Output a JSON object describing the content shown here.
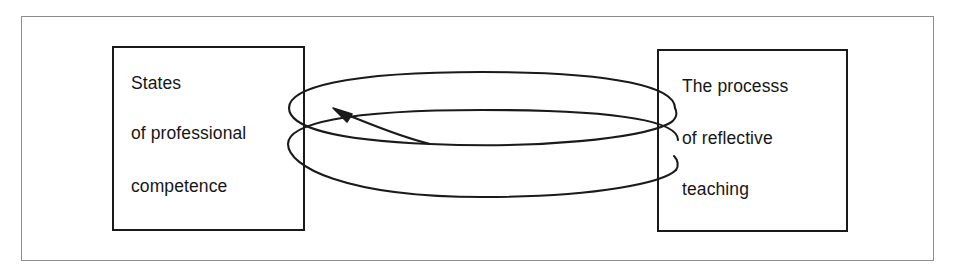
{
  "figure": {
    "kind": "cycle-diagram",
    "background_color": "#ffffff",
    "frame_color": "#8d8d8d",
    "box_border_color": "#1a1a1a",
    "text_color": "#161616",
    "coil_color": "#1a1a1a"
  },
  "left_box": {
    "name": "States of professional competence",
    "lines": [
      "States",
      "of professional",
      "competence"
    ]
  },
  "right_box": {
    "name": "The processs of reflective teaching",
    "lines": [
      "The processs",
      "of reflective",
      "teaching"
    ]
  },
  "connector": {
    "type": "helix",
    "turns": 2,
    "arrow_direction": "left",
    "arrow_label": "",
    "from": "The processs of reflective teaching",
    "to": "States of professional competence"
  }
}
